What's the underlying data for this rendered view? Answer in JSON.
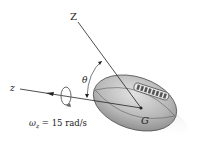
{
  "diagram": {
    "labels": {
      "Z_axis": "Z",
      "z_axis": "z",
      "theta": "θ",
      "center": "G",
      "omega_symbol": "ω",
      "omega_sub": "z",
      "omega_value": " = 15 rad/s"
    },
    "colors": {
      "ball_fill": "#b8b8b8",
      "ball_light": "#d6d6d6",
      "ball_dark": "#8a8a8a",
      "line": "#222222",
      "lace_fill": "#6a6a6a"
    }
  }
}
